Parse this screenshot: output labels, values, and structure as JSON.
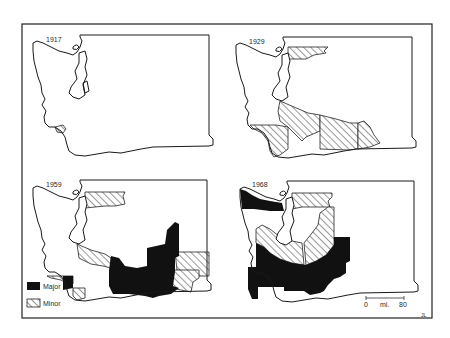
{
  "figure": {
    "type": "map-small-multiples",
    "colors": {
      "background": "#ffffff",
      "ink": "#1a1a1a",
      "major_fill": "#111111",
      "minor_hatch": "#333333"
    }
  },
  "panels": [
    {
      "year": "1917",
      "major_regions": 0,
      "minor_regions": 1
    },
    {
      "year": "1929",
      "major_regions": 0,
      "minor_regions": 4
    },
    {
      "year": "1959",
      "major_regions": 2,
      "minor_regions": 6
    },
    {
      "year": "1968",
      "major_regions": 3,
      "minor_regions": 3
    }
  ],
  "legend": {
    "items": [
      {
        "label": "Major",
        "swatch": "solid-black"
      },
      {
        "label": "Minor",
        "swatch": "diagonal-hatch"
      }
    ]
  },
  "scale_bar": {
    "start": "0",
    "unit": "mi.",
    "end": "80"
  },
  "corner_mark": "JL"
}
